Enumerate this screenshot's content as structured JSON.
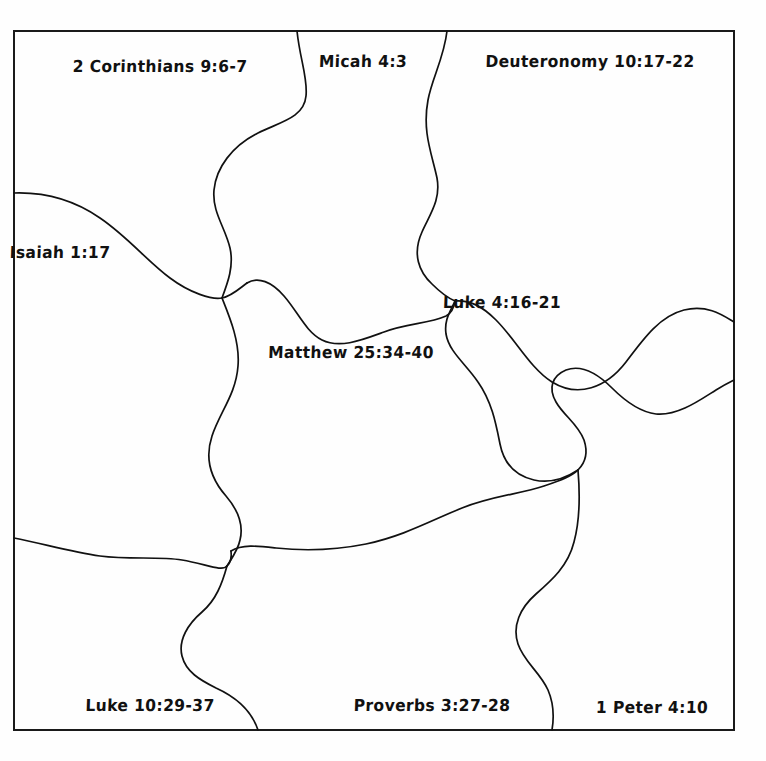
{
  "document": {
    "type": "jigsaw-puzzle-worksheet",
    "title": "Bible Verse Jigsaw Puzzle",
    "background_color": "#fefefe",
    "ink_color": "#111111",
    "frame": {
      "stroke_color": "#1a1a1a",
      "stroke_width": 2,
      "x": 14,
      "y": 31,
      "width": 720,
      "height": 699
    },
    "piece_outline": {
      "stroke_color": "#111111",
      "stroke_width": 1.6,
      "fill": "none"
    }
  },
  "puzzle": {
    "piece_count": 9,
    "rows": 3,
    "columns": 3,
    "pieces": [
      {
        "id": "piece-1",
        "row": 1,
        "col": 1,
        "label": "2 Corinthians 9:6-7",
        "label_x": 160,
        "label_y": 67
      },
      {
        "id": "piece-2",
        "row": 1,
        "col": 2,
        "label": "Micah 4:3",
        "label_x": 363,
        "label_y": 62
      },
      {
        "id": "piece-3",
        "row": 1,
        "col": 3,
        "label": "Deuteronomy 10:17-22",
        "label_x": 590,
        "label_y": 62
      },
      {
        "id": "piece-4",
        "row": 2,
        "col": 1,
        "label": "Isaiah 1:17",
        "label_x": 60,
        "label_y": 253
      },
      {
        "id": "piece-5",
        "row": 2,
        "col": 2,
        "label": "Matthew 25:34-40",
        "label_x": 351,
        "label_y": 353
      },
      {
        "id": "piece-6",
        "row": 2,
        "col": 3,
        "label": "Luke 4:16-21",
        "label_x": 502,
        "label_y": 303
      },
      {
        "id": "piece-7",
        "row": 3,
        "col": 1,
        "label": "Luke 10:29-37",
        "label_x": 150,
        "label_y": 706
      },
      {
        "id": "piece-8",
        "row": 3,
        "col": 2,
        "label": "Proverbs 3:27-28",
        "label_x": 432,
        "label_y": 706
      },
      {
        "id": "piece-9",
        "row": 3,
        "col": 3,
        "label": "1 Peter 4:10",
        "label_x": 652,
        "label_y": 708
      }
    ]
  }
}
